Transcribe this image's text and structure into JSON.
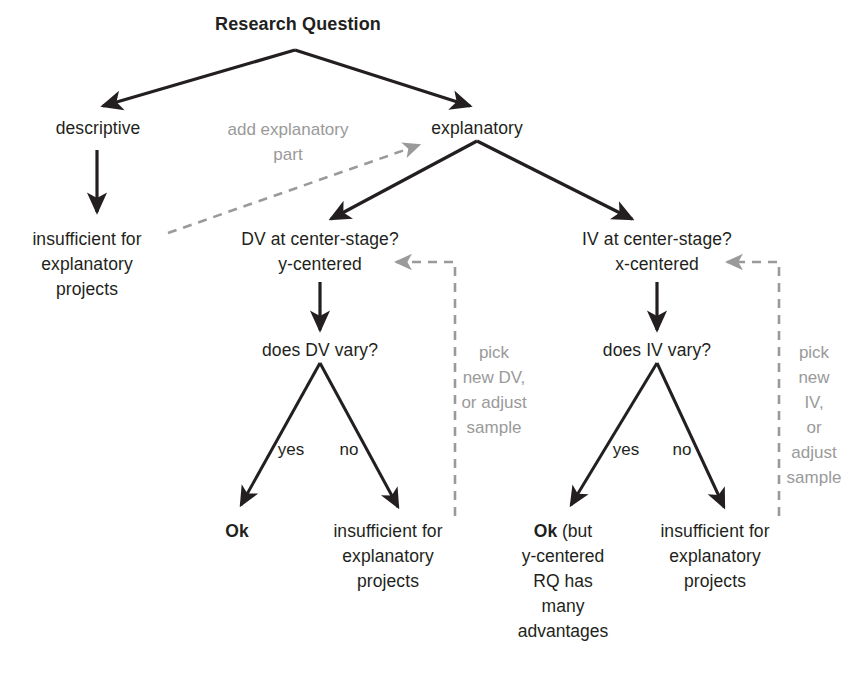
{
  "diagram": {
    "colors": {
      "text": "#231f20",
      "solid_edge": "#231f20",
      "dashed_edge": "#9a9a9a",
      "note_text": "#9a9a9a",
      "background": "#ffffff"
    },
    "nodes": {
      "root": "Research Question",
      "descriptive": "descriptive",
      "explanatory": "explanatory",
      "descriptive_outcome": "insufficient for\nexplanatory\nprojects",
      "dv_center_stage": "DV at center-stage?\ny-centered",
      "iv_center_stage": "IV at center-stage?\nx-centered",
      "does_dv_vary": "does DV vary?",
      "does_iv_vary": "does IV vary?",
      "dv_yes_outcome": "Ok",
      "dv_no_outcome": "insufficient for\nexplanatory\nprojects",
      "iv_yes_outcome_bold": "Ok",
      "iv_yes_outcome_rest": " (but\ny-centered\nRQ has\nmany\nadvantages",
      "iv_no_outcome": "insufficient for\nexplanatory\nprojects"
    },
    "notes": {
      "add_explanatory_part": "add explanatory\npart",
      "pick_new_dv": "pick\nnew DV,\nor adjust\nsample",
      "pick_new_iv": "pick\nnew IV,\nor adjust\nsample"
    },
    "edge_labels": {
      "dv_yes": "yes",
      "dv_no": "no",
      "iv_yes": "yes",
      "iv_no": "no"
    }
  }
}
